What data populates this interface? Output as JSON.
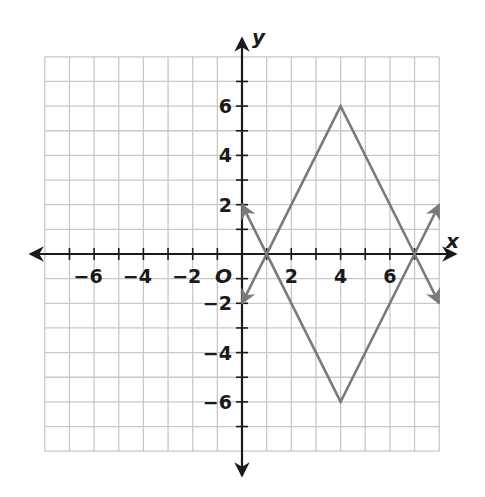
{
  "chart_data": {
    "type": "line",
    "title": "",
    "xlabel": "x",
    "ylabel": "y",
    "origin_label": "O",
    "xlim": [
      -8,
      8
    ],
    "ylim": [
      -8,
      8
    ],
    "grid": true,
    "grid_step": 1,
    "x_tick_labels": [
      {
        "value": -6,
        "label": "−6"
      },
      {
        "value": -4,
        "label": "−4"
      },
      {
        "value": -2,
        "label": "−2"
      },
      {
        "value": 2,
        "label": "2"
      },
      {
        "value": 4,
        "label": "4"
      },
      {
        "value": 6,
        "label": "6"
      }
    ],
    "y_tick_labels": [
      {
        "value": 6,
        "label": "6"
      },
      {
        "value": 4,
        "label": "4"
      },
      {
        "value": 2,
        "label": "2"
      },
      {
        "value": -2,
        "label": "−2"
      },
      {
        "value": -4,
        "label": "−4"
      },
      {
        "value": -6,
        "label": "−6"
      }
    ],
    "series": [
      {
        "name": "upper V (y = -2|x - 4| + 6)",
        "x": [
          0,
          1,
          4,
          7,
          8
        ],
        "y": [
          2,
          0,
          6,
          0,
          -2
        ],
        "arrows_at_ends": true,
        "color": "#7a7a7a"
      },
      {
        "name": "lower V (y = 2|x - 4| - 6)",
        "x": [
          0,
          1,
          4,
          7,
          8
        ],
        "y": [
          -2,
          0,
          -6,
          0,
          2
        ],
        "arrows_at_ends": true,
        "color": "#7a7a7a"
      }
    ],
    "key_points": [
      {
        "label": "x-intercept",
        "x": 1,
        "y": 0
      },
      {
        "label": "x-intercept",
        "x": 7,
        "y": 0
      },
      {
        "label": "vertex max",
        "x": 4,
        "y": 6
      },
      {
        "label": "vertex min",
        "x": 4,
        "y": -6
      }
    ]
  },
  "colors": {
    "grid": "#c8c8c8",
    "axis": "#1a1a1a",
    "curve": "#7a7a7a",
    "background": "#ffffff"
  }
}
